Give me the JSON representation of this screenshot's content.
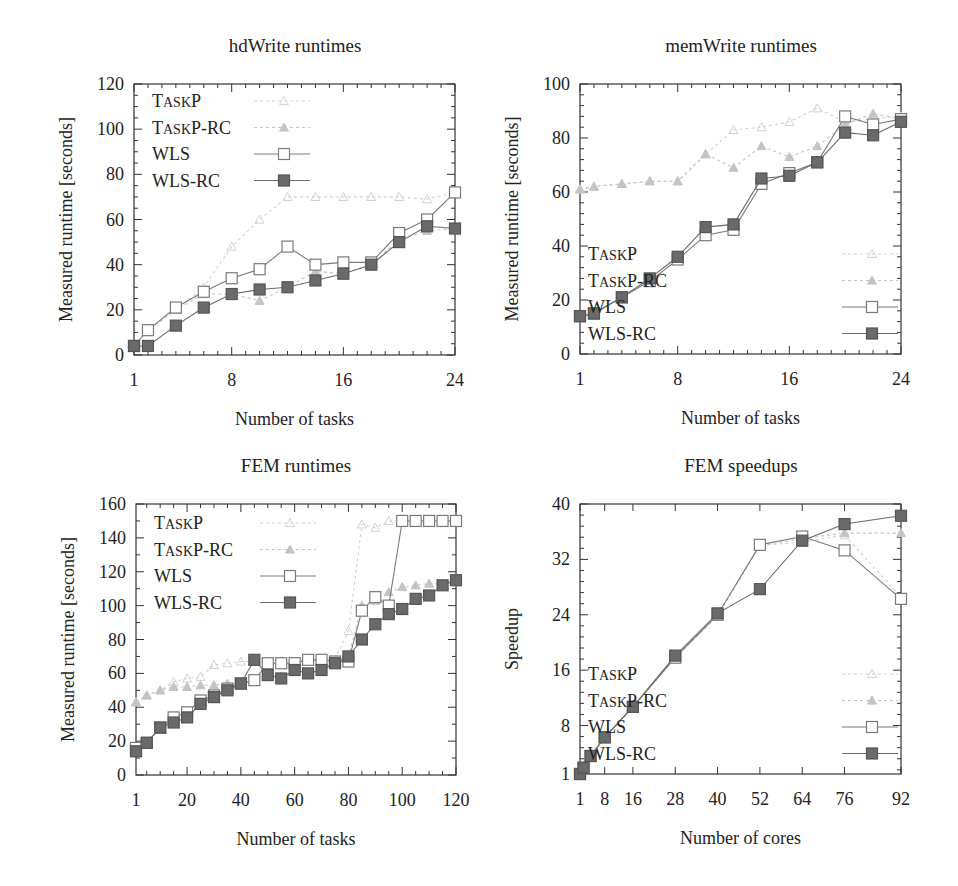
{
  "figure": {
    "legend_labels": [
      "TaskP",
      "TaskP-RC",
      "WLS",
      "WLS-RC"
    ],
    "series_styles": {
      "TaskP": {
        "color": "#d2d2d2",
        "marker": "triangle-open",
        "dash": "3,3"
      },
      "TaskP-RC": {
        "color": "#c4c4c4",
        "marker": "triangle-filled",
        "dash": "3,3"
      },
      "WLS": {
        "color": "#7a7a7a",
        "marker": "square-open",
        "dash": ""
      },
      "WLS-RC": {
        "color": "#6a6a6a",
        "marker": "square-filled",
        "dash": ""
      }
    }
  },
  "chart_data": [
    {
      "id": "hdwrite",
      "type": "line",
      "title": "hdWrite runtimes",
      "xlabel": "Number of tasks",
      "ylabel": "Measured runtime [seconds]",
      "xlim": [
        1,
        24
      ],
      "ylim": [
        0,
        120
      ],
      "xticks": [
        1,
        8,
        16,
        24
      ],
      "yticks": [
        0,
        20,
        40,
        60,
        80,
        100,
        120
      ],
      "grid": false,
      "legend_position": "upper left",
      "x": [
        1,
        2,
        4,
        6,
        8,
        10,
        12,
        14,
        16,
        18,
        20,
        22,
        24
      ],
      "series": [
        {
          "name": "TaskP",
          "values": [
            4,
            11,
            20,
            30,
            48,
            60,
            70,
            70,
            70,
            70,
            70,
            69,
            72
          ]
        },
        {
          "name": "TaskP-RC",
          "values": [
            4,
            11,
            20,
            27,
            27,
            24,
            30,
            37,
            36,
            40,
            51,
            55,
            56
          ]
        },
        {
          "name": "WLS",
          "values": [
            4,
            11,
            21,
            28,
            34,
            38,
            48,
            40,
            41,
            41,
            54,
            60,
            72
          ]
        },
        {
          "name": "WLS-RC",
          "values": [
            4,
            4,
            13,
            21,
            27,
            29,
            30,
            33,
            36,
            40,
            50,
            57,
            56
          ]
        }
      ]
    },
    {
      "id": "memwrite",
      "type": "line",
      "title": "memWrite runtimes",
      "xlabel": "Number of tasks",
      "ylabel": "Measured runtime [seconds]",
      "xlim": [
        1,
        24
      ],
      "ylim": [
        0,
        100
      ],
      "xticks": [
        1,
        8,
        16,
        24
      ],
      "yticks": [
        0,
        20,
        40,
        60,
        80,
        100
      ],
      "grid": false,
      "legend_position": "lower right",
      "x": [
        1,
        2,
        4,
        6,
        8,
        10,
        12,
        14,
        16,
        18,
        20,
        22,
        24
      ],
      "series": [
        {
          "name": "TaskP",
          "values": [
            61,
            62,
            63,
            64,
            64,
            74,
            83,
            84,
            86,
            91,
            86,
            87,
            88
          ]
        },
        {
          "name": "TaskP-RC",
          "values": [
            61,
            62,
            63,
            64,
            64,
            74,
            69,
            77,
            73,
            77,
            85,
            89,
            87
          ]
        },
        {
          "name": "WLS",
          "values": [
            14,
            15,
            21,
            27,
            35,
            44,
            46,
            63,
            67,
            71,
            88,
            85,
            87
          ]
        },
        {
          "name": "WLS-RC",
          "values": [
            14,
            15,
            21,
            28,
            36,
            47,
            48,
            65,
            66,
            71,
            82,
            81,
            86
          ]
        }
      ]
    },
    {
      "id": "fem-runtimes",
      "type": "line",
      "title": "FEM runtimes",
      "xlabel": "Number of tasks",
      "ylabel": "Measured runtime [seconds]",
      "xlim": [
        1,
        120
      ],
      "ylim": [
        0,
        160
      ],
      "xticks": [
        1,
        20,
        40,
        60,
        80,
        100,
        120
      ],
      "yticks": [
        0,
        20,
        40,
        60,
        80,
        100,
        120,
        140,
        160
      ],
      "grid": false,
      "legend_position": "upper left",
      "x": [
        1,
        5,
        10,
        15,
        20,
        25,
        30,
        35,
        40,
        45,
        50,
        55,
        60,
        65,
        70,
        75,
        80,
        85,
        90,
        95,
        100,
        105,
        110,
        115,
        120
      ],
      "series": [
        {
          "name": "TaskP",
          "values": [
            43,
            47,
            50,
            55,
            57,
            58,
            65,
            66,
            67,
            67,
            67,
            67,
            67,
            68,
            68,
            68,
            85,
            148,
            146,
            150,
            150,
            150,
            150,
            150,
            150
          ]
        },
        {
          "name": "TaskP-RC",
          "values": [
            43,
            47,
            50,
            52,
            52,
            53,
            53,
            54,
            54,
            56,
            60,
            58,
            61,
            60,
            62,
            67,
            70,
            100,
            103,
            108,
            111,
            112,
            113,
            113,
            115
          ]
        },
        {
          "name": "WLS",
          "values": [
            16,
            19,
            28,
            34,
            37,
            44,
            47,
            51,
            54,
            56,
            66,
            66,
            66,
            68,
            68,
            67,
            67,
            97,
            105,
            100,
            150,
            150,
            150,
            150,
            150
          ]
        },
        {
          "name": "WLS-RC",
          "values": [
            14,
            19,
            28,
            31,
            34,
            42,
            46,
            50,
            54,
            68,
            59,
            57,
            62,
            60,
            62,
            66,
            70,
            80,
            89,
            95,
            98,
            104,
            106,
            112,
            115
          ]
        }
      ]
    },
    {
      "id": "fem-speedups",
      "type": "line",
      "title": "FEM speedups",
      "xlabel": "Number of cores",
      "ylabel": "Speedup",
      "xlim": [
        1,
        92
      ],
      "ylim": [
        1,
        40
      ],
      "xticks": [
        1,
        8,
        16,
        28,
        40,
        52,
        64,
        76,
        92
      ],
      "yticks": [
        1,
        8,
        16,
        24,
        32,
        40
      ],
      "grid": false,
      "legend_position": "lower right",
      "x": [
        1,
        2,
        4,
        8,
        16,
        28,
        40,
        52,
        64,
        76,
        92
      ],
      "series": [
        {
          "name": "TaskP",
          "values": [
            1,
            1.9,
            3.5,
            6.3,
            10.6,
            17.8,
            23.8,
            34.0,
            34.5,
            35.5,
            26.5
          ]
        },
        {
          "name": "TaskP-RC",
          "values": [
            1,
            1.9,
            3.5,
            6.3,
            10.6,
            17.9,
            24.0,
            34.0,
            35.0,
            35.8,
            35.8
          ]
        },
        {
          "name": "WLS",
          "values": [
            1,
            1.9,
            3.6,
            6.3,
            10.7,
            17.8,
            24.0,
            34.1,
            35.3,
            33.3,
            26.3
          ]
        },
        {
          "name": "WLS-RC",
          "values": [
            1,
            1.9,
            3.6,
            6.3,
            10.7,
            18.1,
            24.2,
            27.7,
            34.7,
            37.1,
            38.3
          ]
        }
      ]
    }
  ]
}
